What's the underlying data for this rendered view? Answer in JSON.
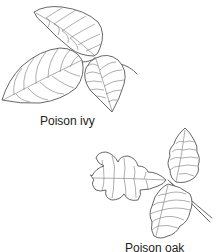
{
  "figure": {
    "background": "#ffffff",
    "stroke_color": "#555555",
    "illustrations": [
      {
        "id": "poison-ivy",
        "label": "Poison ivy",
        "leaflets": 3,
        "style": "line drawing"
      },
      {
        "id": "poison-oak",
        "label": "Poison oak",
        "leaflets": 3,
        "style": "line drawing"
      }
    ]
  }
}
